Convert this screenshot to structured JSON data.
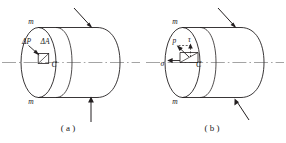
{
  "figure": {
    "panels": [
      {
        "id": "a",
        "caption": "( a )",
        "section_label_top": "m",
        "section_label_bottom": "m",
        "point_label": "C",
        "force_label": "ΔP",
        "area_label": "ΔA",
        "loads": [
          {
            "name": "top-oblique-load",
            "direction": "down-right"
          },
          {
            "name": "bottom-vertical-load",
            "direction": "up"
          }
        ]
      },
      {
        "id": "b",
        "caption": "( b )",
        "section_label_top": "m",
        "section_label_bottom": "m",
        "point_label": "C",
        "normal_stress_label": "σ",
        "resultant_stress_label": "p",
        "shear_stress_label": "τ",
        "loads": [
          {
            "name": "top-oblique-load",
            "direction": "down-right"
          },
          {
            "name": "bottom-oblique-load",
            "direction": "up-left"
          }
        ]
      }
    ],
    "colors": {
      "ink": "#231f20",
      "axis": "#9a9a9a",
      "background": "#ffffff"
    }
  }
}
